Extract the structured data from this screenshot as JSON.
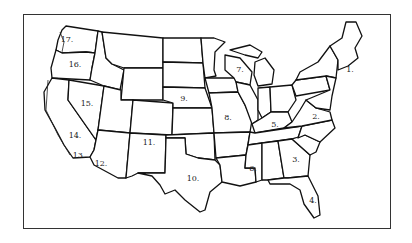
{
  "map": {
    "type": "outline map of the contiguous United States divided into numbered regions",
    "border_color": "#333333",
    "line_color": "#111111",
    "regions": [
      {
        "id": "r1",
        "label": "1.",
        "x": 350,
        "y": 69
      },
      {
        "id": "r2",
        "label": "2.",
        "x": 316,
        "y": 116
      },
      {
        "id": "r3",
        "label": "3.",
        "x": 296,
        "y": 159
      },
      {
        "id": "r4",
        "label": "4.",
        "x": 313,
        "y": 200
      },
      {
        "id": "r5",
        "label": "5.",
        "x": 275,
        "y": 124
      },
      {
        "id": "r6",
        "label": "6.",
        "x": 253,
        "y": 168
      },
      {
        "id": "r7",
        "label": "7.",
        "x": 240,
        "y": 69
      },
      {
        "id": "r8",
        "label": "8.",
        "x": 228,
        "y": 117
      },
      {
        "id": "r9",
        "label": "9.",
        "x": 184,
        "y": 98
      },
      {
        "id": "r10",
        "label": "10.",
        "x": 193,
        "y": 178
      },
      {
        "id": "r11",
        "label": "11.",
        "x": 149,
        "y": 142
      },
      {
        "id": "r12",
        "label": "12.",
        "x": 101,
        "y": 163
      },
      {
        "id": "r13",
        "label": "13.",
        "x": 79,
        "y": 155
      },
      {
        "id": "r14",
        "label": "14.",
        "x": 75,
        "y": 135
      },
      {
        "id": "r15",
        "label": "15.",
        "x": 87,
        "y": 103
      },
      {
        "id": "r16",
        "label": "16.",
        "x": 75,
        "y": 64
      },
      {
        "id": "r17",
        "label": "17.",
        "x": 67,
        "y": 39
      }
    ]
  }
}
